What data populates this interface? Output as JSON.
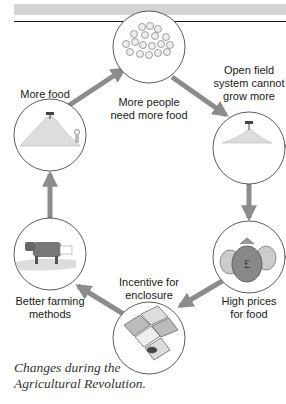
{
  "figure": {
    "caption_lines": [
      "Changes during the",
      "Agricultural Revolution."
    ],
    "colors": {
      "arrow": "#8c8c8c",
      "circle_stroke": "#333333",
      "top_band": "#d4d4d4",
      "rule": "#1a1a1a"
    },
    "nodes": [
      {
        "id": "people",
        "label_lines": [
          "More people",
          "need more food"
        ],
        "icon": "crowd-icon"
      },
      {
        "id": "open-field",
        "label_lines": [
          "Open field",
          "system cannot",
          "grow more"
        ],
        "icon": "small-grain-pile-icon"
      },
      {
        "id": "prices",
        "label_lines": [
          "High prices",
          "for food"
        ],
        "icon": "money-bags-icon"
      },
      {
        "id": "enclosure",
        "label_lines": [
          "Incentive for",
          "enclosure"
        ],
        "icon": "enclosed-fields-icon"
      },
      {
        "id": "farming",
        "label_lines": [
          "Better farming",
          "methods"
        ],
        "icon": "cow-icon"
      },
      {
        "id": "food",
        "label_lines": [
          "More food"
        ],
        "icon": "large-grain-pile-icon"
      }
    ],
    "cycle_order": [
      "More people need more food",
      "Open field system cannot grow more",
      "High prices for food",
      "Incentive for enclosure",
      "Better farming methods",
      "More food"
    ]
  }
}
